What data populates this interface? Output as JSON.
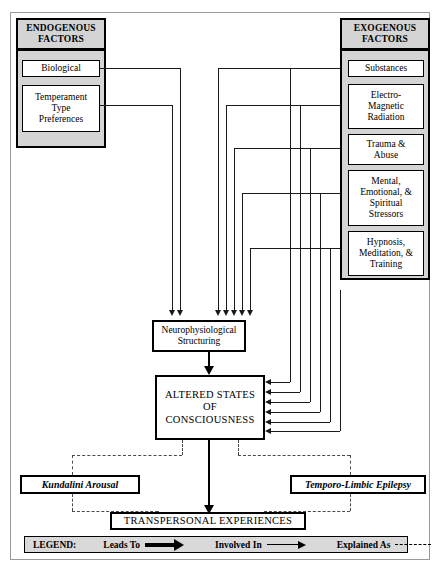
{
  "diagram": {
    "endogenous": {
      "header": "ENDOGENOUS\nFACTORS",
      "header_line1": "ENDOGENOUS",
      "header_line2": "FACTORS",
      "items": [
        {
          "label": "Biological"
        },
        {
          "label": "Temperament\nType\nPreferences",
          "lines": [
            "Temperament",
            "Type",
            "Preferences"
          ]
        }
      ]
    },
    "exogenous": {
      "header_line1": "EXOGENOUS",
      "header_line2": "FACTORS",
      "items": [
        {
          "label": "Substances",
          "lines": [
            "Substances"
          ]
        },
        {
          "label": "Electro-Magnetic Radiation",
          "lines": [
            "Electro-",
            "Magnetic",
            "Radiation"
          ]
        },
        {
          "label": "Trauma & Abuse",
          "lines": [
            "Trauma &",
            "Abuse"
          ]
        },
        {
          "label": "Mental, Emotional, & Spiritual Stressors",
          "lines": [
            "Mental,",
            "Emotional, &",
            "Spiritual",
            "Stressors"
          ]
        },
        {
          "label": "Hypnosis, Meditation, & Training",
          "lines": [
            "Hypnosis,",
            "Meditation, &",
            "Training"
          ]
        }
      ]
    },
    "process": {
      "neuro_line1": "Neurophysiological",
      "neuro_line2": "Structuring",
      "asc_line1": "ALTERED STATES",
      "asc_line2": "OF CONSCIOUSNESS",
      "outcome": "TRANSPERSONAL EXPERIENCES"
    },
    "explanations": [
      {
        "label": "Kundalini Arousal"
      },
      {
        "label": "Temporo-Limbic Epilepsy"
      }
    ],
    "legend": {
      "title": "LEGEND:",
      "entries": [
        {
          "label": "Leads To",
          "style": "thick-arrow"
        },
        {
          "label": "Involved In",
          "style": "thin-arrow"
        },
        {
          "label": "Explained As",
          "style": "dashed"
        }
      ]
    },
    "colors": {
      "panel": "#d4d4d4",
      "legend_bg": "#d9d9d9",
      "line": "#1a1a1a",
      "dashed": "#4a4a4a",
      "frame": "#9a9a9a"
    }
  }
}
